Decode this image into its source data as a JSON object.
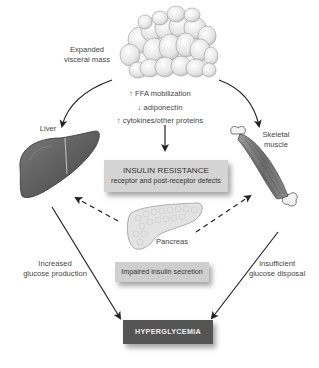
{
  "diagram": {
    "title": "",
    "nodes": {
      "visceral_mass": {
        "label_line1": "Expanded",
        "label_line2": "visceral mass"
      },
      "effects": [
        {
          "arrow": "↑",
          "text": "FFA mobilization"
        },
        {
          "arrow": "↓",
          "text": "adiponectin"
        },
        {
          "arrow": "↑",
          "text": "cytokines/other proteins"
        }
      ],
      "insulin_resistance": {
        "title": "INSULIN RESISTANCE",
        "subtitle": "receptor and post-receptor defects"
      },
      "liver": {
        "label": "Liver"
      },
      "skeletal_muscle": {
        "label_line1": "Skeletal",
        "label_line2": "muscle"
      },
      "pancreas": {
        "label": "Pancreas"
      },
      "impaired_secretion": {
        "label": "Impaired insulin secretion"
      },
      "hyperglycemia": {
        "label": "HYPERGLYCEMIA"
      }
    },
    "edge_labels": {
      "liver_to_hyper": {
        "line1": "Increased",
        "line2": "glucose production"
      },
      "muscle_to_hyper": {
        "line1": "Insufficient",
        "line2": "glucose disposal"
      }
    },
    "edges": [
      {
        "from": "visceral_mass",
        "to": "liver",
        "style": "solid"
      },
      {
        "from": "visceral_mass",
        "to": "skeletal_muscle",
        "style": "solid"
      },
      {
        "from": "effects",
        "to": "insulin_resistance",
        "style": "solid"
      },
      {
        "from": "pancreas",
        "to": "liver",
        "style": "dashed"
      },
      {
        "from": "pancreas",
        "to": "skeletal_muscle",
        "style": "dashed"
      },
      {
        "from": "liver",
        "to": "hyperglycemia",
        "style": "solid"
      },
      {
        "from": "skeletal_muscle",
        "to": "hyperglycemia",
        "style": "solid"
      }
    ],
    "colors": {
      "insulin_resistance_box": "#d4d4d4",
      "impaired_secretion_box": "#cfcfcf",
      "hyperglycemia_box": "#555555",
      "liver": "#5a5a5a",
      "muscle": "#7a7a7a"
    }
  }
}
